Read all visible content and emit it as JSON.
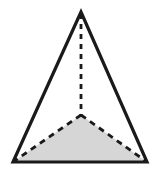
{
  "figure": {
    "name": "triangular-pyramid-diagram",
    "canvas": {
      "width": 157,
      "height": 173,
      "background": "#ffffff"
    },
    "colors": {
      "outline": "#1a1a1a",
      "dashed": "#1a1a1a",
      "shaded_fill": "#d6d6d6",
      "background": "#ffffff"
    },
    "strokes": {
      "outline_width": 3.2,
      "dashed_width": 2.8,
      "dash_pattern_vertical": "5 5",
      "dash_pattern_slant": "6 5"
    },
    "points": {
      "apex": {
        "x": 81,
        "y": 12
      },
      "bottom_left": {
        "x": 13,
        "y": 162
      },
      "bottom_right": {
        "x": 147,
        "y": 162
      },
      "interior": {
        "x": 81,
        "y": 115
      }
    },
    "shapes": {
      "outer_triangle": "81,12 13,162 147,162",
      "shaded_triangle": "81,115 13,162 147,162"
    },
    "segments": {
      "altitude": {
        "from": "apex",
        "to": "interior",
        "style": "dashed"
      },
      "interior_to_left": {
        "from": "interior",
        "to": "bottom_left",
        "style": "dashed"
      },
      "interior_to_right": {
        "from": "interior",
        "to": "bottom_right",
        "style": "dashed"
      }
    }
  }
}
